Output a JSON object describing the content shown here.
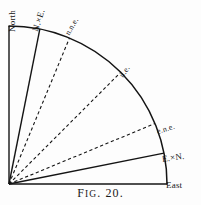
{
  "figure": {
    "caption_prefix": "F",
    "caption_smallcaps": "IG",
    "caption_suffix": ". 20.",
    "caption_full": "FIG. 20.",
    "background_color": "#fdfdfd",
    "ink_color": "#141414"
  },
  "chart_data": {
    "type": "scatter",
    "title": "FIG. 20.",
    "subtitle": "Quarter compass rose from North to East",
    "xlabel": "",
    "ylabel": "",
    "grid": false,
    "legend": "none",
    "origin": {
      "x": 9,
      "y": 184
    },
    "radius": 158,
    "angle_range_deg": [
      0,
      90
    ],
    "categories": [
      "North",
      "N.×E.",
      "n.n.e.",
      "n.e.",
      "e.n.e.",
      "E.×N.",
      "East"
    ],
    "values": [
      90,
      78.75,
      67.5,
      45,
      22.5,
      11.25,
      0
    ],
    "rays": [
      {
        "label": "North",
        "angle_deg": 90,
        "style": "solid",
        "label_rotate_deg": -90,
        "label_x": 12,
        "label_y": 27,
        "font_size": 9
      },
      {
        "label": "N.×E.",
        "angle_deg": 78.75,
        "style": "solid",
        "label_rotate_deg": -72,
        "label_x": 35,
        "label_y": 26,
        "font_size": 9
      },
      {
        "label": "n.n.e.",
        "angle_deg": 67.5,
        "style": "dashed",
        "label_rotate_deg": -60,
        "label_x": 67,
        "label_y": 30,
        "font_size": 8
      },
      {
        "label": "n.e.",
        "angle_deg": 45,
        "style": "dashed",
        "label_rotate_deg": -55,
        "label_x": 121,
        "label_y": 72,
        "font_size": 8
      },
      {
        "label": "e.n.e.",
        "angle_deg": 22.5,
        "style": "dashed",
        "label_rotate_deg": -17,
        "label_x": 157,
        "label_y": 127,
        "font_size": 8
      },
      {
        "label": "E.×N.",
        "angle_deg": 11.25,
        "style": "solid",
        "label_rotate_deg": -8,
        "label_x": 162,
        "label_y": 154,
        "font_size": 9
      },
      {
        "label": "East",
        "angle_deg": 0,
        "style": "solid",
        "label_rotate_deg": 0,
        "label_x": 166,
        "label_y": 180,
        "font_size": 9
      }
    ],
    "arc": {
      "from_deg": 0,
      "to_deg": 90,
      "style": "solid"
    }
  }
}
